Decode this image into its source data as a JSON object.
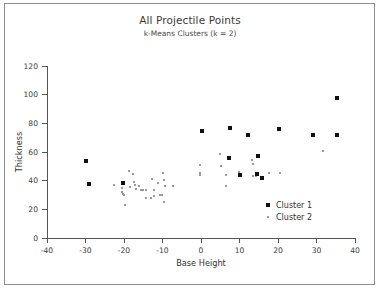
{
  "figure": {
    "title": "All Projectile Points",
    "subtitle": "k-Means Clusters (k = 2)",
    "border_color": "#8c8c8c",
    "background": "#ffffff"
  },
  "legend": {
    "position": "inside-bottom-right",
    "entries": [
      {
        "label": "Cluster 1",
        "marker": "filled-square-large",
        "color": "#111111",
        "size_px": 4
      },
      {
        "label": "Cluster 2",
        "marker": "filled-square-small",
        "color": "#9a9a9a",
        "size_px": 2
      }
    ]
  },
  "chart_data": {
    "type": "scatter",
    "title": "All Projectile Points",
    "subtitle": "k-Means Clusters (k = 2)",
    "xlabel": "Base Height",
    "ylabel": "Thickness",
    "xlim": [
      -40,
      40
    ],
    "ylim": [
      0,
      120
    ],
    "xticks": [
      -40,
      -30,
      -20,
      -10,
      0,
      10,
      20,
      30,
      40
    ],
    "yticks": [
      0,
      20,
      40,
      60,
      80,
      100,
      120
    ],
    "xtick_labels": [
      "-40",
      "-30",
      "-20",
      "-10",
      "0",
      "10",
      "20",
      "30",
      "40"
    ],
    "ytick_labels": [
      "0",
      "20",
      "40",
      "60",
      "80",
      "100",
      "120"
    ],
    "grid": false,
    "legend": [
      "Cluster 1",
      "Cluster 2"
    ],
    "series": [
      {
        "name": "Cluster 1",
        "color": "#111111",
        "marker": "square",
        "marker_size": 4,
        "points": [
          [
            -30.0,
            53.5
          ],
          [
            -29.0,
            38.0
          ],
          [
            -20.3,
            38.5
          ],
          [
            0.2,
            74.8
          ],
          [
            7.6,
            77.0
          ],
          [
            7.2,
            55.8
          ],
          [
            10.2,
            43.8
          ],
          [
            12.2,
            72.0
          ],
          [
            14.8,
            57.0
          ],
          [
            14.6,
            44.5
          ],
          [
            15.8,
            41.8
          ],
          [
            20.3,
            75.8
          ],
          [
            29.2,
            72.0
          ],
          [
            35.2,
            98.0
          ],
          [
            35.2,
            72.0
          ]
        ]
      },
      {
        "name": "Cluster 2",
        "color": "#9a9a9a",
        "marker": "square",
        "marker_size": 2,
        "points": [
          [
            -22.6,
            36.8
          ],
          [
            -20.6,
            35.2
          ],
          [
            -20.4,
            32.3
          ],
          [
            -20.2,
            30.6
          ],
          [
            -20.1,
            29.8
          ],
          [
            -19.8,
            22.7
          ],
          [
            -18.6,
            46.6
          ],
          [
            -18.4,
            35.3
          ],
          [
            -17.6,
            44.8
          ],
          [
            -17.4,
            39.0
          ],
          [
            -17.2,
            37.2
          ],
          [
            -17.0,
            34.2
          ],
          [
            -16.2,
            36.0
          ],
          [
            -15.6,
            33.5
          ],
          [
            -15.1,
            33.2
          ],
          [
            -14.4,
            33.8
          ],
          [
            -14.2,
            28.0
          ],
          [
            -13.1,
            27.6
          ],
          [
            -12.6,
            41.0
          ],
          [
            -12.3,
            33.4
          ],
          [
            -12.1,
            29.6
          ],
          [
            -11.1,
            38.6
          ],
          [
            -10.6,
            30.3
          ],
          [
            -10.2,
            29.8
          ],
          [
            -9.8,
            45.7
          ],
          [
            -9.6,
            40.8
          ],
          [
            -9.4,
            36.6
          ],
          [
            -9.7,
            25.0
          ],
          [
            -7.2,
            36.6
          ],
          [
            -0.2,
            51.0
          ],
          [
            -0.3,
            45.2
          ],
          [
            -0.3,
            43.8
          ],
          [
            5.0,
            58.8
          ],
          [
            5.1,
            50.0
          ],
          [
            6.6,
            44.0
          ],
          [
            6.5,
            36.0
          ],
          [
            9.8,
            45.8
          ],
          [
            13.2,
            54.2
          ],
          [
            13.4,
            51.8
          ],
          [
            13.6,
            43.3
          ],
          [
            14.2,
            43.0
          ],
          [
            17.6,
            45.2
          ],
          [
            20.6,
            45.4
          ],
          [
            31.8,
            61.0
          ]
        ]
      }
    ]
  },
  "caption": ""
}
